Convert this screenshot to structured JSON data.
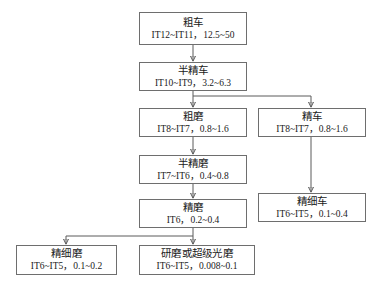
{
  "diagram": {
    "background_color": "#ffffff",
    "box_border_color": "#6e6e6e",
    "edge_color": "#5a5a5a",
    "nodes": [
      {
        "id": "rough-turning",
        "title": "粗车",
        "spec": "IT12~IT11，12.5~50"
      },
      {
        "id": "semi-finish-turning",
        "title": "半精车",
        "spec": "IT10~IT9，3.2~6.3"
      },
      {
        "id": "rough-grinding",
        "title": "粗磨",
        "spec": "IT8~IT7，0.8~1.6"
      },
      {
        "id": "finish-turning",
        "title": "精车",
        "spec": "IT8~IT7，0.8~1.6"
      },
      {
        "id": "semi-finish-grinding",
        "title": "半精磨",
        "spec": "IT7~IT6，0.4~0.8"
      },
      {
        "id": "finish-grinding",
        "title": "精磨",
        "spec": "IT6，0.2~0.4"
      },
      {
        "id": "fine-turning",
        "title": "精细车",
        "spec": "IT6~IT5，0.1~0.4"
      },
      {
        "id": "fine-grinding",
        "title": "精细磨",
        "spec": "IT6~IT5，0.1~0.2"
      },
      {
        "id": "lapping-superfinish",
        "title": "研磨或超级光磨",
        "spec": "IT6~IT5，0.008~0.1"
      }
    ],
    "edges": [
      {
        "from": "rough-turning",
        "to": "semi-finish-turning",
        "style": "straight"
      },
      {
        "from": "semi-finish-turning",
        "to": "rough-grinding",
        "style": "straight"
      },
      {
        "from": "semi-finish-turning",
        "to": "finish-turning",
        "style": "elbow-right"
      },
      {
        "from": "rough-grinding",
        "to": "semi-finish-grinding",
        "style": "straight"
      },
      {
        "from": "semi-finish-grinding",
        "to": "finish-grinding",
        "style": "straight"
      },
      {
        "from": "finish-turning",
        "to": "fine-turning",
        "style": "straight"
      },
      {
        "from": "finish-grinding",
        "to": "lapping-superfinish",
        "style": "straight"
      },
      {
        "from": "finish-grinding",
        "to": "fine-grinding",
        "style": "elbow-left"
      }
    ]
  }
}
